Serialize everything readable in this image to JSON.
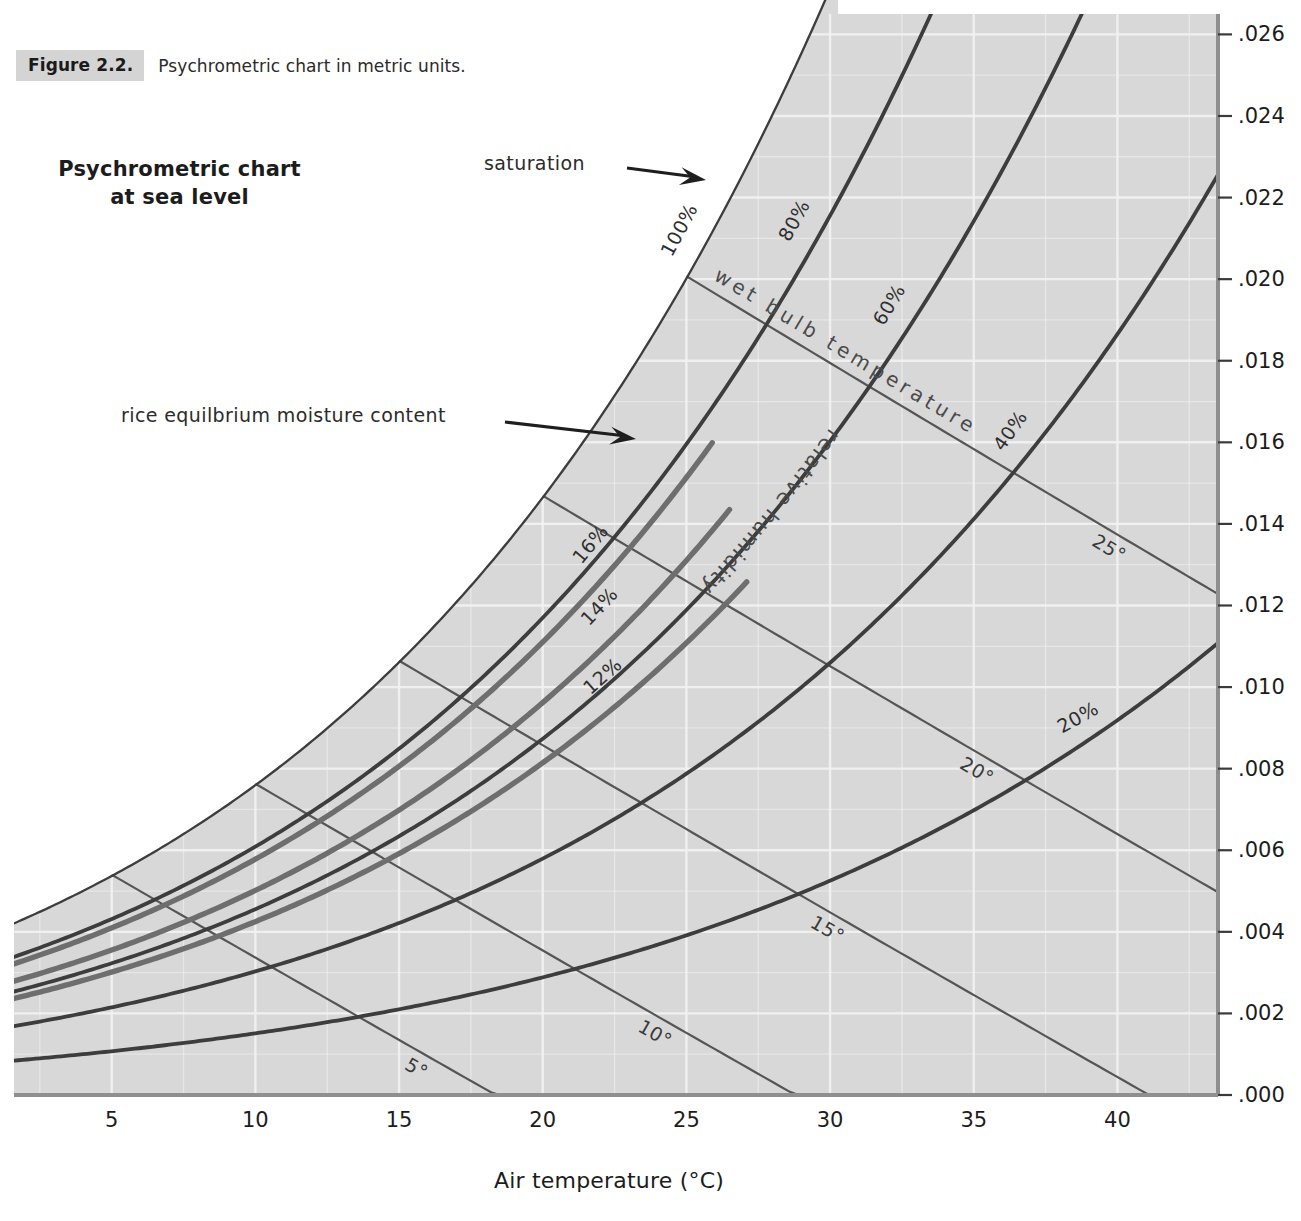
{
  "caption": {
    "figure_label": "Figure 2.2.",
    "text": "Psychrometric chart in metric units."
  },
  "chart_title_line1": "Psychrometric chart",
  "chart_title_line2": "at sea level",
  "annotations": {
    "saturation": "saturation",
    "rice_emc": "rice equilbrium moisture content",
    "wet_bulb": "wet bulb temperature",
    "relative_humidity": "relative humidity"
  },
  "colors": {
    "plot_background": "#d8d8d8",
    "gridline": "#f2f2f2",
    "curve": "#3d3d3d",
    "emc_curve": "#6e6e6e",
    "text": "#1c1c1c",
    "caption_chip": "#d4d4d4"
  },
  "chart_data": {
    "type": "line",
    "title": "Psychrometric chart at sea level",
    "xlabel": "Air temperature (°C)",
    "ylabel": "",
    "xlim": [
      1.6,
      43.5
    ],
    "ylim": [
      0.0,
      0.0265
    ],
    "grid": true,
    "legend": "inline-curve-labels",
    "x_ticks": [
      5,
      10,
      15,
      20,
      25,
      30,
      35,
      40
    ],
    "x_tick_labels": [
      "5",
      "10",
      "15",
      "20",
      "25",
      "30",
      "35",
      "40"
    ],
    "y_ticks": [
      0.0,
      0.002,
      0.004,
      0.006,
      0.008,
      0.01,
      0.012,
      0.014,
      0.016,
      0.018,
      0.02,
      0.022,
      0.024,
      0.026
    ],
    "y_tick_labels": [
      ".000",
      ".002",
      ".004",
      ".006",
      ".008",
      ".010",
      ".012",
      ".014",
      ".016",
      ".018",
      ".020",
      ".022",
      ".024",
      ".026"
    ],
    "series": [
      {
        "name": "100%",
        "kind": "relative-humidity",
        "rh": 100,
        "label": "100%",
        "label_t": 25.6,
        "label_rot": -62
      },
      {
        "name": "80%",
        "kind": "relative-humidity",
        "rh": 80,
        "label": "80%",
        "label_t": 29.6,
        "label_rot": -61
      },
      {
        "name": "60%",
        "kind": "relative-humidity",
        "rh": 60,
        "label": "60%",
        "label_t": 32.9,
        "label_rot": -59
      },
      {
        "name": "40%",
        "kind": "relative-humidity",
        "rh": 40,
        "label": "40%",
        "label_t": 37.1,
        "label_rot": -55
      },
      {
        "name": "20%",
        "kind": "relative-humidity",
        "rh": 20,
        "label": "20%",
        "label_t": 39.3,
        "label_rot": -29
      }
    ],
    "wet_bulb_lines": [
      {
        "label": "5°",
        "value": 5,
        "label_t": 15.5
      },
      {
        "label": "10°",
        "value": 10,
        "label_t": 23.8
      },
      {
        "label": "15°",
        "value": 15,
        "label_t": 29.8
      },
      {
        "label": "20°",
        "value": 20,
        "label_t": 35.0
      },
      {
        "label": "25°",
        "value": 25,
        "label_t": 39.6
      }
    ],
    "rice_emc_curves": [
      {
        "label": "16%",
        "value": 16,
        "rh_equiv": 76,
        "label_t": 22.6,
        "t_end": 25.9
      },
      {
        "label": "14%",
        "value": 14,
        "rh_equiv": 66,
        "label_t": 22.9,
        "t_end": 26.6
      },
      {
        "label": "12%",
        "value": 12,
        "rh_equiv": 56,
        "label_t": 23.0,
        "t_end": 27.2
      }
    ],
    "notes": [
      "Saturation curve is the 100% relative humidity line",
      "Humidity ratio (kg water / kg dry air) on right vertical axis"
    ]
  }
}
